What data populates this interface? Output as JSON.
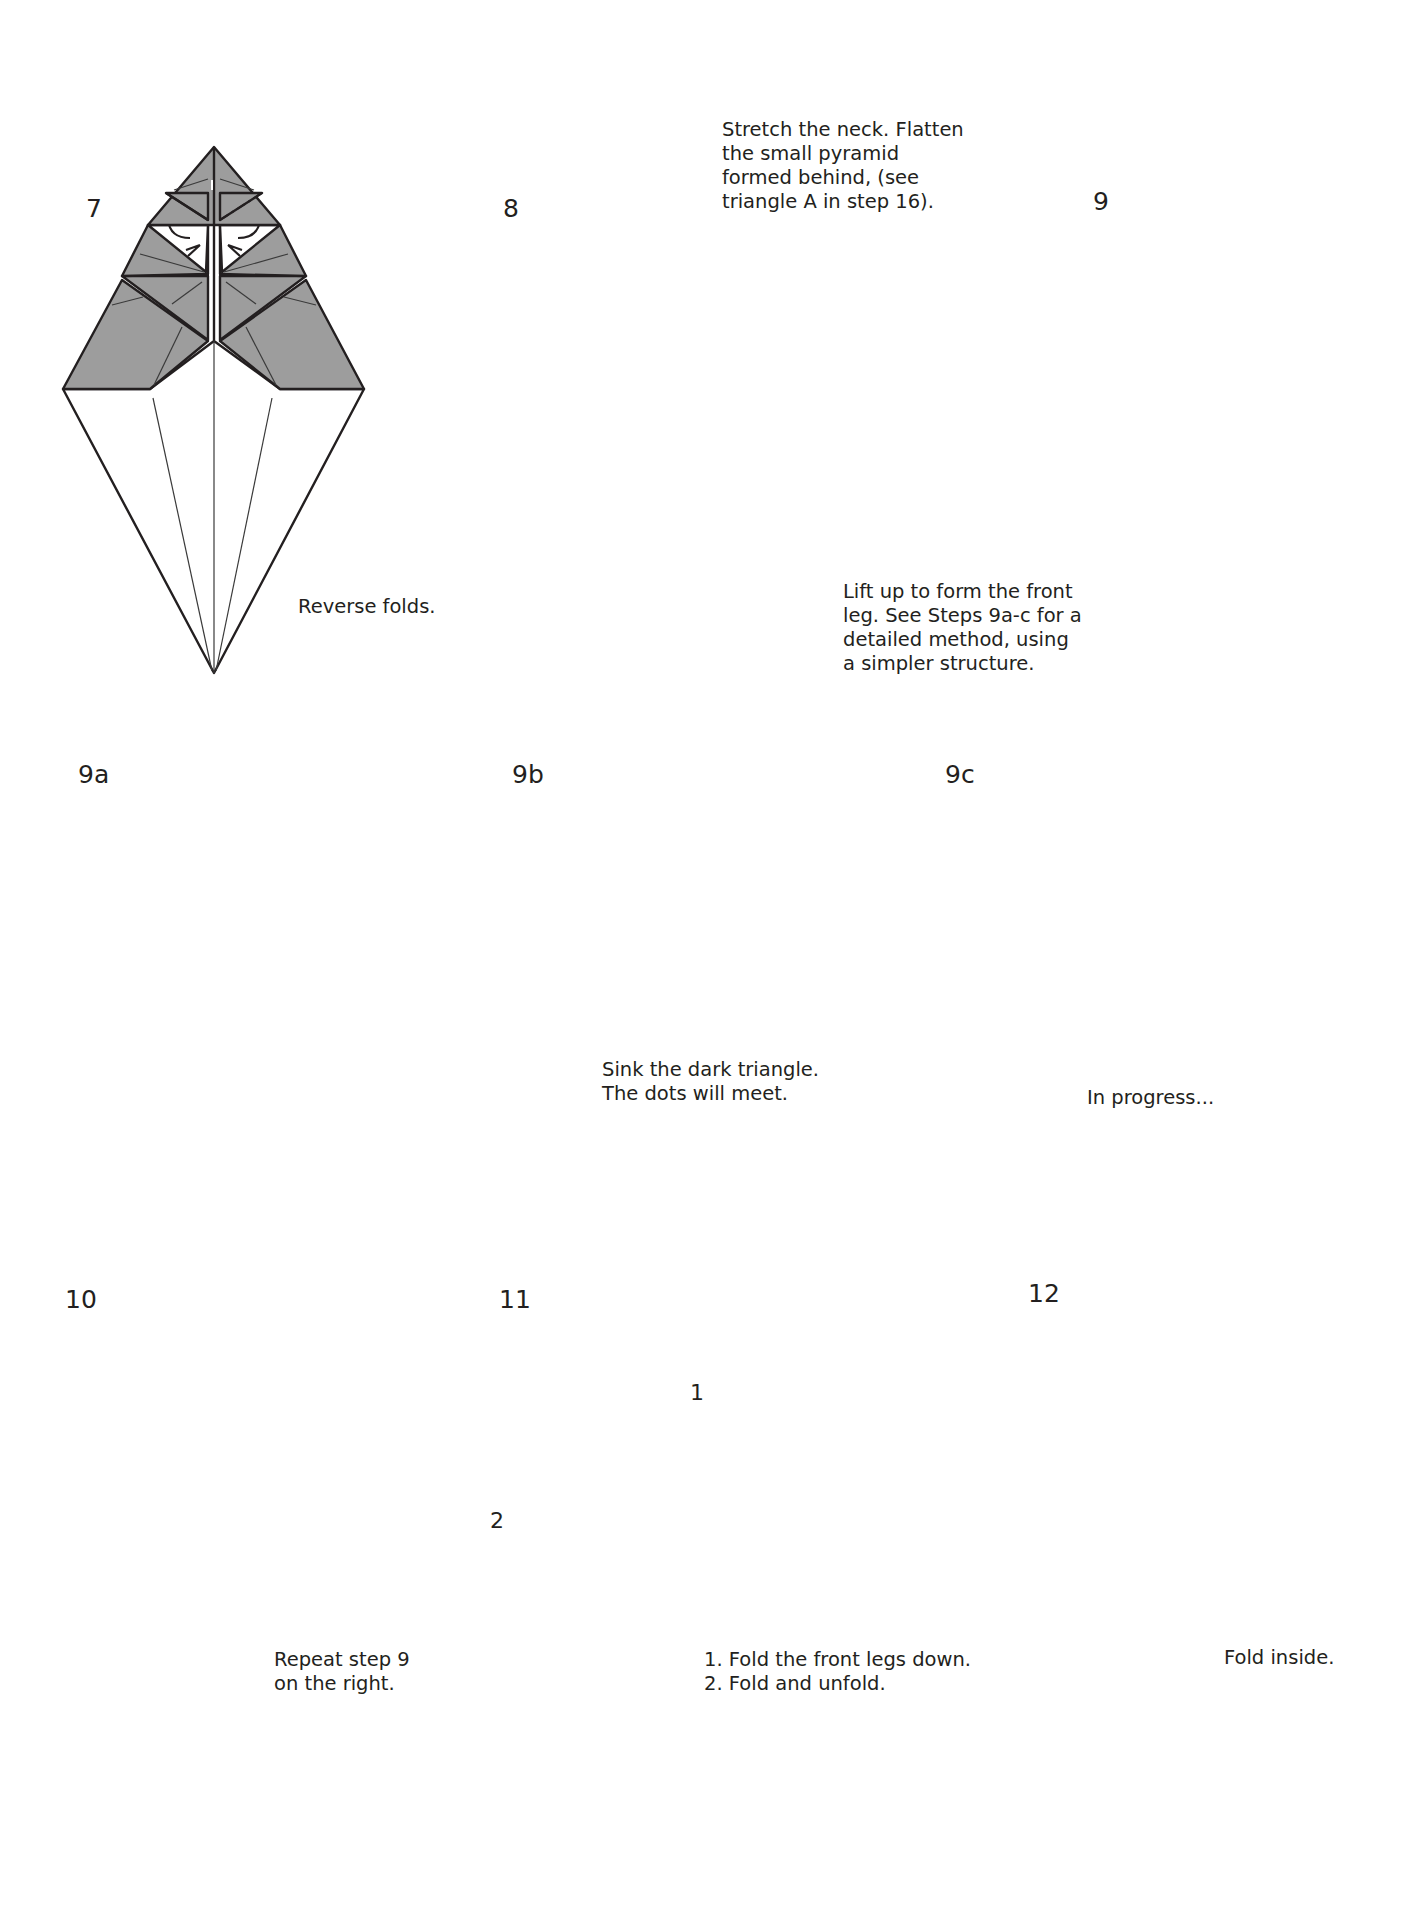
{
  "page": {
    "paper_color": "#9d9d9d",
    "white_side_color": "#ffffff",
    "line_color": "#231f20"
  },
  "steps": [
    {
      "id": "7",
      "label": "7",
      "caption": "Reverse folds."
    },
    {
      "id": "8",
      "label": "8",
      "caption": "Stretch the neck. Flatten\nthe small pyramid\nformed behind, (see\ntriangle A in step 16)."
    },
    {
      "id": "9",
      "label": "9",
      "caption": "Lift up to form the front\nleg. See Steps 9a-c for a\ndetailed method, using\na simpler structure."
    },
    {
      "id": "9a",
      "label": "9a",
      "caption": ""
    },
    {
      "id": "9b",
      "label": "9b",
      "caption": "Sink the dark triangle.\nThe dots will meet."
    },
    {
      "id": "9c",
      "label": "9c",
      "caption": "In progress..."
    },
    {
      "id": "10",
      "label": "10",
      "caption": "Repeat step 9\non the right."
    },
    {
      "id": "11",
      "label": "11",
      "caption": "1. Fold the front legs down.\n2. Fold and unfold.",
      "markers": [
        "1",
        "2"
      ]
    },
    {
      "id": "12",
      "label": "12",
      "caption": "Fold inside."
    }
  ]
}
